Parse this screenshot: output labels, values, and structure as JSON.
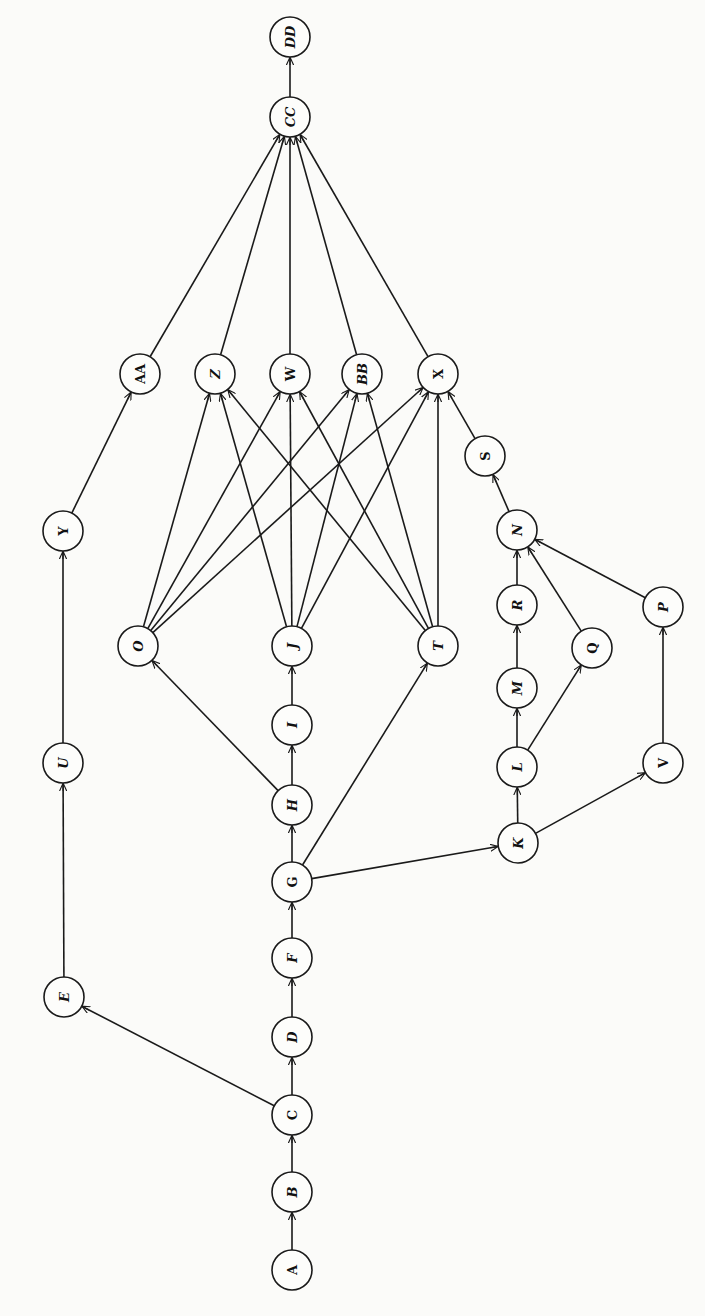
{
  "diagram": {
    "type": "directed-graph",
    "orientation": "rotated-90-ccw",
    "node_radius": 20,
    "colors": {
      "stroke": "#1a1a1a",
      "node_fill": "#fdfdfb",
      "background": "#fbfbf9",
      "text": "#111111"
    },
    "nodes": [
      {
        "id": "A",
        "label": "A",
        "x": 292,
        "y": 1270,
        "italic": false
      },
      {
        "id": "B",
        "label": "B",
        "x": 292,
        "y": 1192,
        "italic": true
      },
      {
        "id": "C",
        "label": "C",
        "x": 292,
        "y": 1115,
        "italic": false
      },
      {
        "id": "D",
        "label": "D",
        "x": 292,
        "y": 1037,
        "italic": true
      },
      {
        "id": "E",
        "label": "E",
        "x": 64,
        "y": 997,
        "italic": true
      },
      {
        "id": "F",
        "label": "F",
        "x": 292,
        "y": 958,
        "italic": true
      },
      {
        "id": "G",
        "label": "G",
        "x": 292,
        "y": 882,
        "italic": false
      },
      {
        "id": "H",
        "label": "H",
        "x": 292,
        "y": 805,
        "italic": true
      },
      {
        "id": "I",
        "label": "I",
        "x": 292,
        "y": 725,
        "italic": true
      },
      {
        "id": "J",
        "label": "J",
        "x": 292,
        "y": 646,
        "italic": true
      },
      {
        "id": "K",
        "label": "K",
        "x": 518,
        "y": 843,
        "italic": true
      },
      {
        "id": "L",
        "label": "L",
        "x": 517,
        "y": 767,
        "italic": true
      },
      {
        "id": "M",
        "label": "M",
        "x": 517,
        "y": 688,
        "italic": true
      },
      {
        "id": "N",
        "label": "N",
        "x": 517,
        "y": 530,
        "italic": true
      },
      {
        "id": "O",
        "label": "O",
        "x": 138,
        "y": 646,
        "italic": true
      },
      {
        "id": "P",
        "label": "P",
        "x": 663,
        "y": 607,
        "italic": true
      },
      {
        "id": "Q",
        "label": "Q",
        "x": 592,
        "y": 648,
        "italic": false
      },
      {
        "id": "R",
        "label": "R",
        "x": 517,
        "y": 605,
        "italic": true
      },
      {
        "id": "S",
        "label": "S",
        "x": 485,
        "y": 456,
        "italic": false
      },
      {
        "id": "T",
        "label": "T",
        "x": 438,
        "y": 646,
        "italic": true
      },
      {
        "id": "U",
        "label": "U",
        "x": 63,
        "y": 763,
        "italic": true
      },
      {
        "id": "V",
        "label": "V",
        "x": 663,
        "y": 763,
        "italic": false
      },
      {
        "id": "W",
        "label": "W",
        "x": 290,
        "y": 374,
        "italic": false
      },
      {
        "id": "X",
        "label": "X",
        "x": 438,
        "y": 374,
        "italic": false
      },
      {
        "id": "Y",
        "label": "Y",
        "x": 63,
        "y": 531,
        "italic": false
      },
      {
        "id": "Z",
        "label": "Z",
        "x": 215,
        "y": 374,
        "italic": true
      },
      {
        "id": "AA",
        "label": "AA",
        "x": 140,
        "y": 374,
        "italic": false
      },
      {
        "id": "BB",
        "label": "BB",
        "x": 362,
        "y": 374,
        "italic": true
      },
      {
        "id": "CC",
        "label": "CC",
        "x": 290,
        "y": 117,
        "italic": true
      },
      {
        "id": "DD",
        "label": "DD",
        "x": 290,
        "y": 37,
        "italic": true
      }
    ],
    "edges": [
      {
        "from": "A",
        "to": "B"
      },
      {
        "from": "B",
        "to": "C"
      },
      {
        "from": "C",
        "to": "D"
      },
      {
        "from": "C",
        "to": "E"
      },
      {
        "from": "D",
        "to": "F"
      },
      {
        "from": "F",
        "to": "G"
      },
      {
        "from": "G",
        "to": "H"
      },
      {
        "from": "G",
        "to": "T"
      },
      {
        "from": "G",
        "to": "K"
      },
      {
        "from": "H",
        "to": "I"
      },
      {
        "from": "H",
        "to": "O"
      },
      {
        "from": "I",
        "to": "J"
      },
      {
        "from": "E",
        "to": "U"
      },
      {
        "from": "U",
        "to": "Y"
      },
      {
        "from": "Y",
        "to": "AA"
      },
      {
        "from": "K",
        "to": "L"
      },
      {
        "from": "K",
        "to": "V"
      },
      {
        "from": "L",
        "to": "M"
      },
      {
        "from": "L",
        "to": "Q"
      },
      {
        "from": "M",
        "to": "R"
      },
      {
        "from": "R",
        "to": "N"
      },
      {
        "from": "Q",
        "to": "N"
      },
      {
        "from": "V",
        "to": "P"
      },
      {
        "from": "P",
        "to": "N"
      },
      {
        "from": "N",
        "to": "S"
      },
      {
        "from": "S",
        "to": "X"
      },
      {
        "from": "O",
        "to": "Z"
      },
      {
        "from": "O",
        "to": "W"
      },
      {
        "from": "O",
        "to": "BB"
      },
      {
        "from": "O",
        "to": "X"
      },
      {
        "from": "J",
        "to": "Z"
      },
      {
        "from": "J",
        "to": "W"
      },
      {
        "from": "J",
        "to": "BB"
      },
      {
        "from": "J",
        "to": "X"
      },
      {
        "from": "T",
        "to": "Z"
      },
      {
        "from": "T",
        "to": "W"
      },
      {
        "from": "T",
        "to": "BB"
      },
      {
        "from": "T",
        "to": "X"
      },
      {
        "from": "AA",
        "to": "CC"
      },
      {
        "from": "Z",
        "to": "CC"
      },
      {
        "from": "W",
        "to": "CC"
      },
      {
        "from": "BB",
        "to": "CC"
      },
      {
        "from": "X",
        "to": "CC"
      },
      {
        "from": "CC",
        "to": "DD"
      }
    ]
  }
}
